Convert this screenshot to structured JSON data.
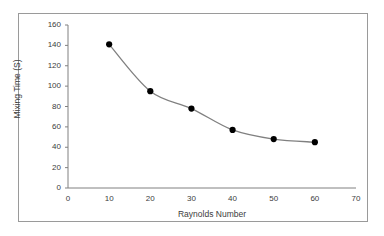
{
  "figure": {
    "border_color": "#9a9a9a",
    "background_color": "#ffffff"
  },
  "chart_data": {
    "type": "line",
    "title": "",
    "subtitle": "",
    "xlabel": "Raynolds Number",
    "ylabel": "Mixing Time (S)",
    "xlim": [
      0,
      70
    ],
    "ylim": [
      0,
      160
    ],
    "xticks": [
      0,
      10,
      20,
      30,
      40,
      50,
      60,
      70
    ],
    "yticks": [
      0,
      20,
      40,
      60,
      80,
      100,
      120,
      140,
      160
    ],
    "grid": false,
    "legend": false,
    "legend_position": "none",
    "marker": "filled-circle",
    "marker_color": "#000000",
    "line_color": "#808080",
    "line_style": "smooth",
    "x": [
      10,
      20,
      30,
      40,
      50,
      60
    ],
    "values": [
      141,
      95,
      78,
      57,
      48,
      45
    ],
    "series": [
      {
        "name": "Mixing Time",
        "x": [
          10,
          20,
          30,
          40,
          50,
          60
        ],
        "values": [
          141,
          95,
          78,
          57,
          48,
          45
        ]
      }
    ],
    "annotations": []
  }
}
